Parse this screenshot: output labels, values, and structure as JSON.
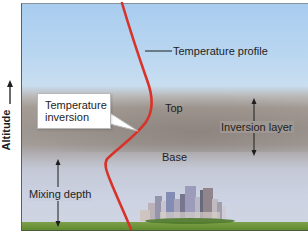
{
  "diagram": {
    "axis": {
      "y_label": "Altitude",
      "arrow": "up-arrow"
    },
    "labels": {
      "temperature_profile": "Temperature profile",
      "temperature_inversion_line1": "Temperature",
      "temperature_inversion_line2": "inversion",
      "top": "Top",
      "base": "Base",
      "inversion_layer": "Inversion layer",
      "mixing_depth": "Mixing depth"
    },
    "colors": {
      "profile_line": "#d8322a",
      "sky_top": "#a9cdef",
      "inversion_band": "#9d958f",
      "lower_air": "#ccd2e2",
      "ground": "#6a9436"
    },
    "layers": [
      {
        "name": "Clear sky above inversion"
      },
      {
        "name": "Inversion layer",
        "bounds": [
          "Top",
          "Base"
        ]
      },
      {
        "name": "Mixing layer",
        "measure": "Mixing depth"
      }
    ],
    "scene": {
      "city": "city-skyline",
      "ground": "grass"
    }
  }
}
